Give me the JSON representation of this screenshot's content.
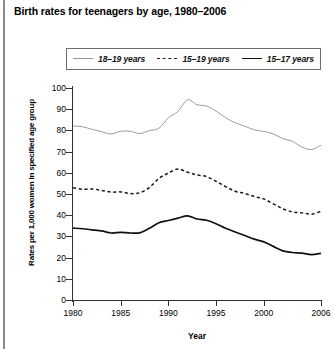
{
  "chart_data": {
    "type": "line",
    "title": "Birth rates for teenagers by age, 1980–2006",
    "xlabel": "Year",
    "ylabel": "Rates per 1,000 women in specified age group",
    "xlim": [
      1980,
      2006
    ],
    "ylim": [
      0,
      100
    ],
    "ytick_labels": [
      "0",
      "10",
      "20",
      "30",
      "40",
      "50",
      "60",
      "70",
      "80",
      "90",
      "100"
    ],
    "yticks": [
      0,
      10,
      20,
      30,
      40,
      50,
      60,
      70,
      80,
      90,
      100
    ],
    "xtick_labels": [
      "1980",
      "1985",
      "1990",
      "1995",
      "2000",
      "2006"
    ],
    "xticks": [
      1980,
      1985,
      1990,
      1995,
      2000,
      2006
    ],
    "grid": false,
    "legend_position": "top",
    "x": [
      1980,
      1981,
      1982,
      1983,
      1984,
      1985,
      1986,
      1987,
      1988,
      1989,
      1990,
      1991,
      1992,
      1993,
      1994,
      1995,
      1996,
      1997,
      1998,
      1999,
      2000,
      2001,
      2002,
      2003,
      2004,
      2005,
      2006
    ],
    "series": [
      {
        "name": "18–19 years",
        "style": "solid-thin",
        "color": "#9b9b9b",
        "values": [
          82.1,
          81.7,
          80.5,
          79.4,
          78.3,
          79.6,
          79.6,
          78.5,
          79.9,
          81.0,
          85.9,
          89.0,
          94.4,
          92.1,
          91.5,
          89.1,
          86.0,
          83.6,
          82.0,
          80.3,
          79.5,
          78.4,
          76.1,
          74.9,
          72.1,
          71.0,
          73.0
        ]
      },
      {
        "name": "15–19 years",
        "style": "dashed",
        "color": "#1b1b1b",
        "values": [
          53.0,
          52.2,
          52.4,
          51.7,
          50.9,
          51.0,
          50.2,
          50.6,
          53.0,
          57.3,
          59.9,
          61.8,
          60.3,
          59.0,
          58.2,
          56.0,
          53.5,
          51.3,
          50.3,
          48.8,
          47.7,
          45.3,
          43.0,
          41.6,
          41.1,
          40.5,
          41.9
        ]
      },
      {
        "name": "15–17 years",
        "style": "solid-bold",
        "color": "#111111",
        "values": [
          33.9,
          33.6,
          33.1,
          32.6,
          31.6,
          31.9,
          31.6,
          31.7,
          33.8,
          36.4,
          37.5,
          38.6,
          39.7,
          38.2,
          37.6,
          36.0,
          33.8,
          32.1,
          30.4,
          28.7,
          27.4,
          25.3,
          23.2,
          22.4,
          22.1,
          21.4,
          22.0
        ]
      }
    ]
  },
  "legend": {
    "items": [
      {
        "label": "18–19 years"
      },
      {
        "label": "15–19 years"
      },
      {
        "label": "15–17 years"
      }
    ]
  }
}
